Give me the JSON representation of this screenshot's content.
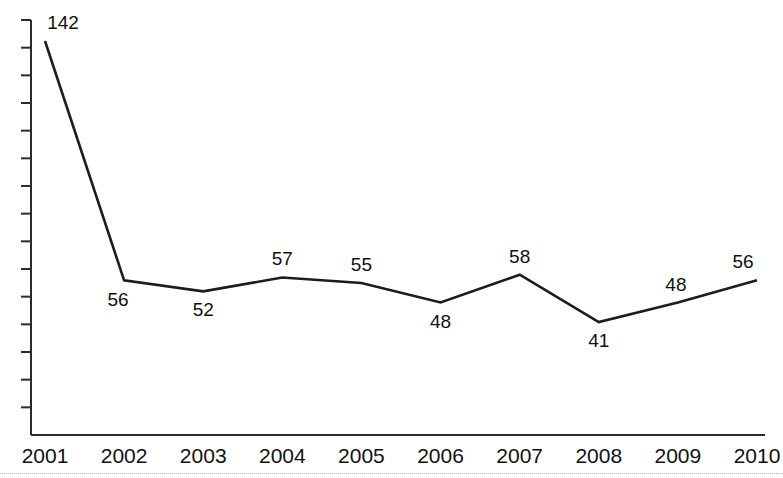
{
  "chart_data": {
    "type": "line",
    "title": "",
    "subtitle": "",
    "xlabel": "",
    "ylabel": "",
    "categories": [
      "2001",
      "2002",
      "2003",
      "2004",
      "2005",
      "2006",
      "2007",
      "2008",
      "2009",
      "2010"
    ],
    "values": [
      142,
      56,
      52,
      57,
      55,
      48,
      58,
      41,
      48,
      56
    ],
    "point_labels": [
      "142",
      "56",
      "52",
      "57",
      "55",
      "48",
      "58",
      "41",
      "48",
      "56"
    ],
    "label_positions": [
      "above",
      "below",
      "below",
      "above",
      "above",
      "below",
      "above",
      "below",
      "above",
      "above"
    ],
    "series": [
      {
        "name": "",
        "values": [
          142,
          56,
          52,
          57,
          55,
          48,
          58,
          41,
          48,
          56
        ]
      }
    ],
    "ylim": [
      0,
      155
    ],
    "xlim": [
      "2001",
      "2010"
    ],
    "grid": false,
    "legend": false,
    "legend_position": "none",
    "y_axis_ticks_labeled": false,
    "y_axis_tick_count": 15,
    "line_color": "#1c1c1c",
    "axis_color": "#2b2b2b",
    "background_color": "#ffffff",
    "annotations": []
  },
  "axis": {
    "x_tick_labels": [
      "2001",
      "2002",
      "2003",
      "2004",
      "2005",
      "2006",
      "2007",
      "2008",
      "2009",
      "2010"
    ]
  },
  "colors": {
    "line": "#1c1c1c",
    "axis": "#2b2b2b",
    "text": "#111111",
    "background": "#ffffff",
    "rule": "#b9b9b9"
  }
}
